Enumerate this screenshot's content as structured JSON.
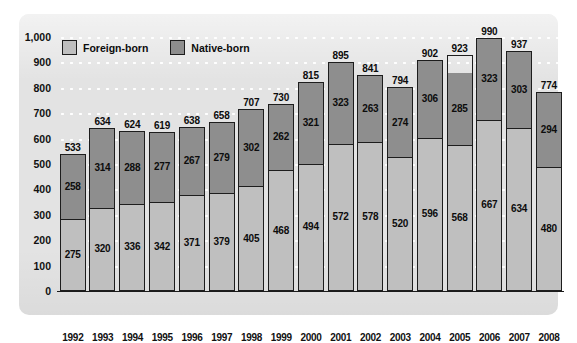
{
  "chart_data": {
    "type": "bar",
    "subtype": "stacked-vertical",
    "title": "",
    "subtitle": "",
    "xlabel": "",
    "ylabel": "",
    "ylim": [
      0,
      1000
    ],
    "yticks": [
      "0",
      "100",
      "200",
      "300",
      "400",
      "500",
      "600",
      "700",
      "800",
      "900",
      "1,000"
    ],
    "ytick_values": [
      0,
      100,
      200,
      300,
      400,
      500,
      600,
      700,
      800,
      900,
      1000
    ],
    "grid": true,
    "grid_style": "white-dotted-horizontal",
    "legend_position": "top-left-inside",
    "categories": [
      "1992",
      "1993",
      "1994",
      "1995",
      "1996",
      "1997",
      "1998",
      "1999",
      "2000",
      "2001",
      "2002",
      "2003",
      "2004",
      "2005",
      "2006",
      "2007",
      "2008"
    ],
    "series": [
      {
        "name": "Foreign-born",
        "color": "#bfbfbf",
        "stack_order": 1,
        "values": [
          275,
          320,
          336,
          342,
          371,
          379,
          405,
          468,
          494,
          572,
          578,
          520,
          596,
          568,
          667,
          634,
          480
        ]
      },
      {
        "name": "Native-born",
        "color": "#8e8e8e",
        "stack_order": 2,
        "values": [
          258,
          314,
          288,
          277,
          267,
          279,
          302,
          262,
          321,
          323,
          263,
          274,
          306,
          285,
          323,
          303,
          294
        ]
      }
    ],
    "totals": [
      533,
      634,
      624,
      619,
      638,
      658,
      707,
      730,
      815,
      895,
      841,
      794,
      902,
      923,
      990,
      937,
      774
    ],
    "total_labels": [
      "533",
      "634",
      "624",
      "619",
      "638",
      "658",
      "707",
      "730",
      "815",
      "895",
      "841",
      "794",
      "902",
      "923",
      "990",
      "937",
      "774"
    ]
  },
  "legend": {
    "items": [
      {
        "label": "Foreign-born",
        "swatch": "foreign-born-swatch"
      },
      {
        "label": "Native-born",
        "swatch": "native-born-swatch"
      }
    ]
  },
  "colors": {
    "panel_background": "#e3e3e3",
    "foreign_born": "#bfbfbf",
    "native_born": "#8e8e8e",
    "outline": "#1d1d1d",
    "gridline": "#ffffff",
    "text": "#0c0c0c"
  }
}
